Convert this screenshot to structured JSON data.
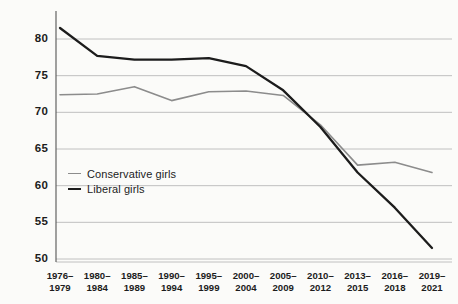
{
  "chart_data": {
    "type": "line",
    "title": "",
    "xlabel": "",
    "ylabel": "",
    "grid": true,
    "legend_position": "inside-left",
    "ylim": [
      50,
      82
    ],
    "yticks": [
      50,
      55,
      60,
      65,
      70,
      75,
      80
    ],
    "categories": [
      "1976–\n1979",
      "1980–\n1984",
      "1985–\n1989",
      "1990–\n1994",
      "1995–\n1999",
      "2000–\n2004",
      "2005–\n2009",
      "2010–\n2012",
      "2013–\n2015",
      "2016–\n2018",
      "2019–\n2021"
    ],
    "categories_line1": [
      "1976–",
      "1980–",
      "1985–",
      "1990–",
      "1995–",
      "2000–",
      "2005–",
      "2010–",
      "2013–",
      "2016–",
      "2019–"
    ],
    "categories_line2": [
      "1979",
      "1984",
      "1989",
      "1994",
      "1999",
      "2004",
      "2009",
      "2012",
      "2015",
      "2018",
      "2021"
    ],
    "series": [
      {
        "name": "Conservative girls",
        "color": "#8c8c8c",
        "width": 1.6,
        "values": [
          72.4,
          72.5,
          73.5,
          71.6,
          72.8,
          72.9,
          72.3,
          68.3,
          62.8,
          63.2,
          61.8
        ]
      },
      {
        "name": "Liberal girls",
        "color": "#1c1c1c",
        "width": 2.3,
        "values": [
          81.5,
          77.7,
          77.2,
          77.2,
          77.4,
          76.3,
          73.0,
          68.0,
          61.8,
          57.0,
          51.5
        ]
      }
    ]
  },
  "axis": {
    "tick_labels_y": [
      "80",
      "75",
      "70",
      "65",
      "60",
      "55",
      "50"
    ]
  },
  "legend": {
    "items": [
      {
        "label": "Conservative girls"
      },
      {
        "label": "Liberal girls"
      }
    ]
  },
  "style": {
    "background": "#fbfbf9",
    "gridline_color": "#b9b9b9",
    "axis_color": "#555555",
    "text_color": "#1c1c1c"
  }
}
